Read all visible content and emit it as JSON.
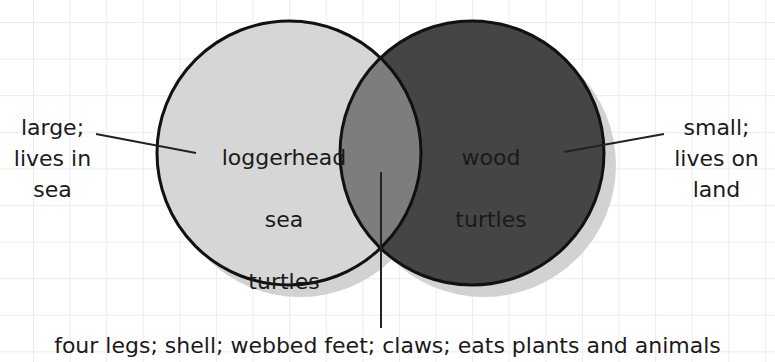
{
  "diagram": {
    "type": "venn",
    "sets": [
      {
        "id": "left",
        "label_lines": [
          "loggerhead",
          "sea",
          "turtles"
        ],
        "fill": "#d6d6d6"
      },
      {
        "id": "right",
        "label_lines": [
          "wood",
          "turtles"
        ],
        "fill": "#454545"
      }
    ],
    "overlap_fill": "#7d7d7d",
    "callouts": {
      "left": "large;\nlives in\nsea",
      "right": "small;\nlives on\nland",
      "bottom": "four legs; shell; webbed feet; claws; eats plants and animals"
    },
    "colors": {
      "grid": "#ececec",
      "outline": "#111111",
      "shadow": "#cfcfcf"
    }
  }
}
